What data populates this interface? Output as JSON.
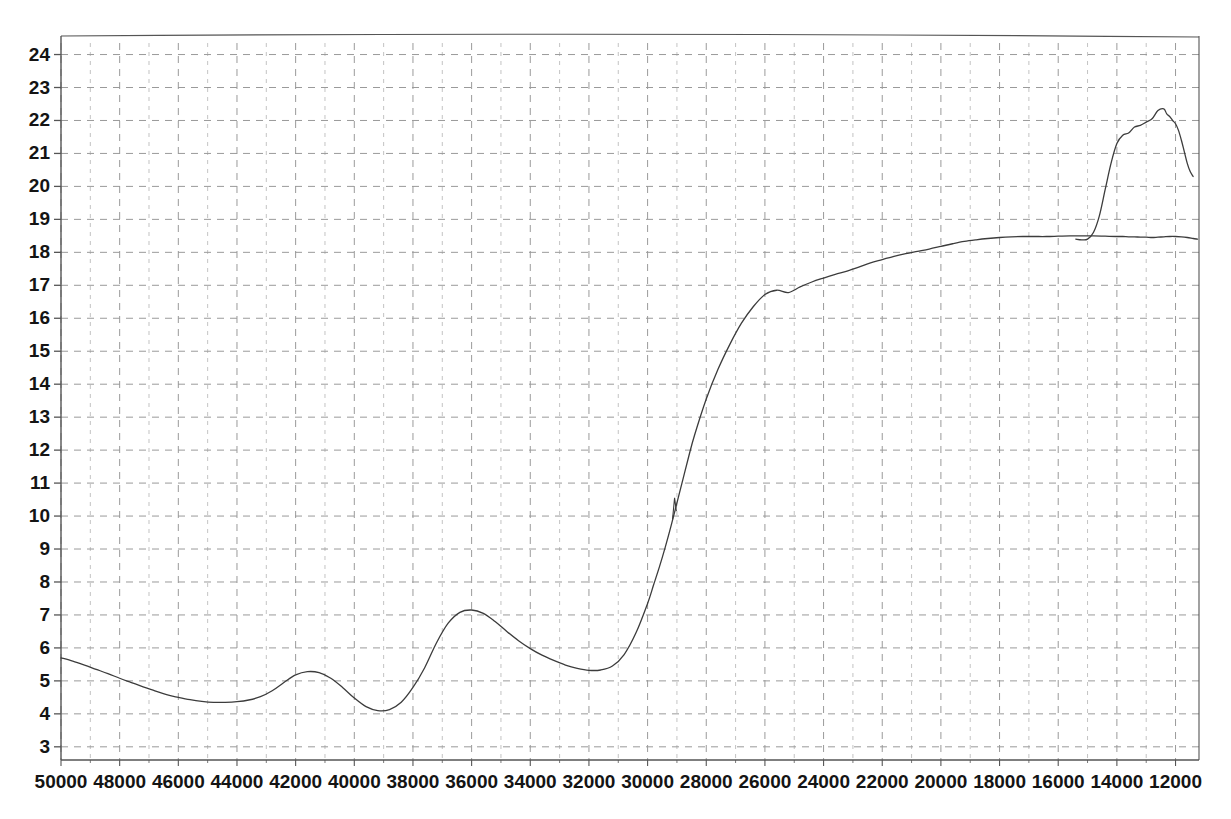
{
  "chart_data": {
    "type": "line",
    "title": "",
    "subtitle": "",
    "xlabel": "",
    "ylabel": "",
    "xlim": [
      50000,
      11200
    ],
    "ylim": [
      2.6,
      24.35
    ],
    "x_axis_reversed": true,
    "grid": true,
    "legend": false,
    "legend_position": "none",
    "x_ticks": [
      50000,
      48000,
      46000,
      44000,
      42000,
      40000,
      38000,
      36000,
      34000,
      32000,
      30000,
      28000,
      26000,
      24000,
      22000,
      20000,
      18000,
      16000,
      14000,
      12000
    ],
    "x_tick_labels": [
      "50000",
      "48000",
      "46000",
      "44000",
      "42000",
      "40000",
      "38000",
      "36000",
      "34000",
      "32000",
      "30000",
      "28000",
      "26000",
      "24000",
      "22000",
      "20000",
      "18000",
      "16000",
      "14000",
      "12000"
    ],
    "x_minor_tick_step": 1000,
    "y_ticks": [
      3,
      4,
      5,
      6,
      7,
      8,
      9,
      10,
      11,
      12,
      13,
      14,
      15,
      16,
      17,
      18,
      19,
      20,
      21,
      22,
      23,
      24
    ],
    "y_tick_labels": [
      "3",
      "4",
      "5",
      "6",
      "7",
      "8",
      "9",
      "10",
      "11",
      "12",
      "13",
      "14",
      "15",
      "16",
      "17",
      "18",
      "19",
      "20",
      "21",
      "22",
      "23",
      "24"
    ],
    "series": [
      {
        "name": "spectrum",
        "color": "#3c3c3c",
        "line_width": 1.3,
        "x": [
          50000,
          49600,
          49200,
          48800,
          48400,
          48000,
          47600,
          47200,
          46800,
          46400,
          46000,
          45600,
          45200,
          44800,
          44400,
          44000,
          43600,
          43200,
          42800,
          42400,
          42000,
          41600,
          41200,
          40800,
          40400,
          40000,
          39600,
          39200,
          38800,
          38400,
          38000,
          37600,
          37200,
          36800,
          36400,
          36000,
          35600,
          35200,
          34800,
          34400,
          34000,
          33600,
          33200,
          32800,
          32400,
          32000,
          31600,
          31200,
          30800,
          30400,
          30000,
          29800,
          29600,
          29400,
          29200,
          29000,
          28800,
          28600,
          28400,
          28000,
          27600,
          27200,
          26800,
          26400,
          26000,
          25600,
          25200,
          24800,
          24400,
          24000,
          23600,
          23200,
          22800,
          22400,
          22000,
          21600,
          21200,
          20800,
          20400,
          20000,
          19600,
          19200,
          18800,
          18400,
          18000,
          17600,
          17200,
          16800,
          16400,
          16000,
          15600,
          15200,
          14800,
          14400,
          14000,
          13800,
          13600,
          13400,
          13200,
          13000,
          12800,
          12600,
          12400,
          12200,
          12000,
          11800,
          11600,
          11400,
          11250
        ],
        "y": [
          5.7,
          5.6,
          5.48,
          5.35,
          5.22,
          5.08,
          4.95,
          4.82,
          4.7,
          4.58,
          4.5,
          4.43,
          4.38,
          4.35,
          4.35,
          4.37,
          4.42,
          4.52,
          4.7,
          4.95,
          5.18,
          5.28,
          5.25,
          5.08,
          4.8,
          4.48,
          4.22,
          4.1,
          4.13,
          4.35,
          4.8,
          5.4,
          6.15,
          6.75,
          7.08,
          7.15,
          7.05,
          6.8,
          6.5,
          6.22,
          5.98,
          5.78,
          5.62,
          5.48,
          5.38,
          5.32,
          5.33,
          5.45,
          5.8,
          6.45,
          7.35,
          7.9,
          8.45,
          9.05,
          9.7,
          10.4,
          11.1,
          11.8,
          12.45,
          13.55,
          14.45,
          15.2,
          15.85,
          16.35,
          16.72,
          16.85,
          16.78,
          16.95,
          17.1,
          17.22,
          17.33,
          17.43,
          17.55,
          17.68,
          17.78,
          17.88,
          17.96,
          18.03,
          18.1,
          18.18,
          18.26,
          18.33,
          18.38,
          18.42,
          18.45,
          18.47,
          18.48,
          18.48,
          18.48,
          18.49,
          18.5,
          18.5,
          18.5,
          18.49,
          18.48,
          18.48,
          18.47,
          18.47,
          18.46,
          18.46,
          18.45,
          18.46,
          18.47,
          18.48,
          18.48,
          18.47,
          18.45,
          18.42,
          18.4
        ]
      },
      {
        "name": "spectrum-tail",
        "color": "#3c3c3c",
        "line_width": 1.3,
        "x": [
          15400,
          15200,
          15000,
          14800,
          14600,
          14400,
          14200,
          14000,
          13800,
          13600,
          13400,
          13200,
          13000,
          12800,
          12600,
          12400,
          12300,
          12200,
          12100,
          12000,
          11900,
          11800,
          11700,
          11600,
          11500,
          11400
        ],
        "y": [
          18.4,
          18.38,
          18.4,
          18.6,
          19.1,
          19.9,
          20.7,
          21.3,
          21.55,
          21.62,
          21.8,
          21.85,
          21.95,
          22.05,
          22.3,
          22.35,
          22.2,
          22.12,
          22.0,
          21.9,
          21.7,
          21.4,
          21.05,
          20.7,
          20.45,
          20.3
        ]
      }
    ]
  },
  "figure": {
    "border_color": "#555555",
    "grid_color": "#9a9a9a",
    "tick_label_color": "#141414",
    "background": "#ffffff"
  }
}
